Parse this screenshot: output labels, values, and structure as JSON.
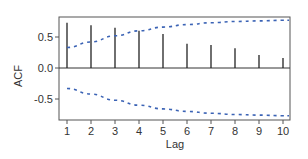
{
  "chart_data": {
    "type": "bar",
    "subtype": "acf-stem",
    "title": "",
    "xlabel": "Lag",
    "ylabel": "ACF",
    "categories": [
      1,
      2,
      3,
      4,
      5,
      6,
      7,
      8,
      9,
      10
    ],
    "x_ticks": [
      "1",
      "2",
      "3",
      "4",
      "5",
      "6",
      "7",
      "8",
      "9",
      "10"
    ],
    "y_ticks": [
      "0.5",
      "0.0",
      "-0.5"
    ],
    "y_tick_values": [
      0.5,
      0.0,
      -0.5
    ],
    "ylim": [
      -0.85,
      0.82
    ],
    "xlim": [
      0.7,
      10.3
    ],
    "grid": false,
    "legend": null,
    "series": [
      {
        "name": "ACF",
        "kind": "stem",
        "color": "#222222",
        "values": [
          0.73,
          0.69,
          0.65,
          0.6,
          0.55,
          0.39,
          0.37,
          0.32,
          0.21,
          0.16
        ]
      },
      {
        "name": "Upper confidence bound",
        "kind": "dashed-line",
        "color": "#3b63b5",
        "values": [
          0.33,
          0.42,
          0.52,
          0.6,
          0.66,
          0.7,
          0.73,
          0.75,
          0.76,
          0.77
        ]
      },
      {
        "name": "Lower confidence bound",
        "kind": "dashed-line",
        "color": "#3b63b5",
        "values": [
          -0.33,
          -0.42,
          -0.52,
          -0.6,
          -0.66,
          -0.7,
          -0.73,
          -0.75,
          -0.76,
          -0.77
        ]
      }
    ]
  }
}
